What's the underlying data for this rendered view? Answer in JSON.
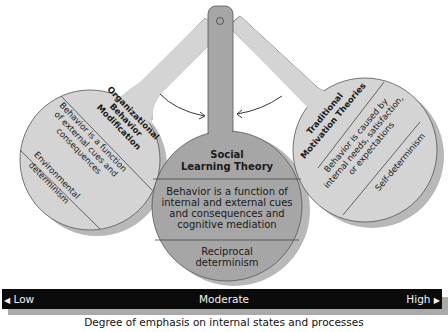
{
  "diagram": {
    "center_paddle": {
      "title_line1": "Social",
      "title_line2": "Learning Theory",
      "section1": [
        "Behavior is a function of",
        "internal and external cues",
        "and consequences and",
        "cognitive mediation"
      ],
      "section2": [
        "Reciprocal",
        "determinism"
      ],
      "fill": "#a6a6a6"
    },
    "left_paddle": {
      "title": [
        "Organizational",
        "Behavior",
        "Modification"
      ],
      "section1": [
        "Behavior is a function",
        "of external cues and",
        "consequences"
      ],
      "section2": [
        "Environmental",
        "determinism"
      ],
      "fill": "#d4d4d4"
    },
    "right_paddle": {
      "title": [
        "Traditional",
        "Motivation Theories"
      ],
      "section1": [
        "Behavior is caused by",
        "internal needs, satisfaction,",
        "or expectations"
      ],
      "section2": [
        "Self-determinism"
      ],
      "fill": "#d4d4d4"
    },
    "scale": {
      "low": "Low",
      "moderate": "Moderate",
      "high": "High",
      "low_arrow": "◀",
      "high_arrow": "▶",
      "caption": "Degree of emphasis on internal states and processes"
    }
  }
}
